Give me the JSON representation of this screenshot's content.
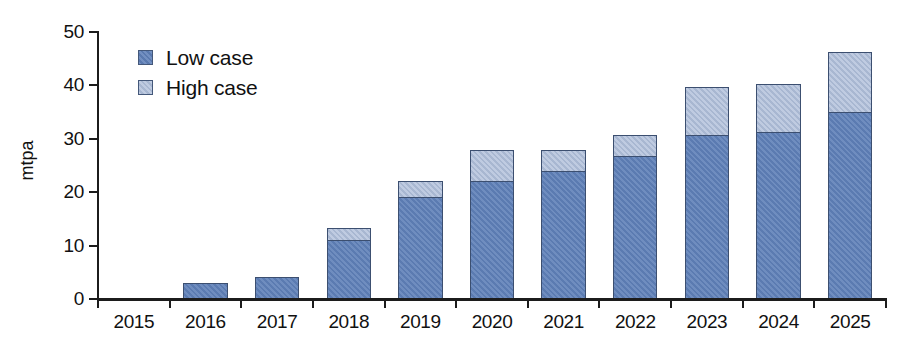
{
  "chart_data": {
    "type": "bar",
    "title": "",
    "subtitle": "",
    "xlabel": "",
    "ylabel": "mtpa",
    "stacked": true,
    "grid": false,
    "legend_position": "top-left",
    "ylim": [
      0,
      50
    ],
    "yticks": [
      0,
      10,
      20,
      30,
      40,
      50
    ],
    "ytick_labels": [
      "0",
      "10",
      "20",
      "30",
      "40",
      "50"
    ],
    "categories": [
      "2015",
      "2016",
      "2017",
      "2018",
      "2019",
      "2020",
      "2021",
      "2022",
      "2023",
      "2024",
      "2025"
    ],
    "series": [
      {
        "name": "Low case",
        "color": "#5f80b8",
        "values": [
          0,
          3.0,
          4.2,
          11.0,
          19.0,
          22.0,
          24.0,
          26.8,
          30.6,
          31.2,
          35.0
        ]
      },
      {
        "name": "High case",
        "color": "#adbdd8",
        "note": "segment drawn above the low case, up to the high case total",
        "totals": [
          0,
          3.0,
          4.2,
          13.2,
          22.0,
          27.8,
          27.8,
          30.6,
          39.6,
          40.1,
          46.2
        ],
        "increments": [
          0,
          0,
          0,
          2.2,
          3.0,
          5.8,
          3.8,
          3.8,
          9.0,
          8.9,
          11.2
        ]
      }
    ],
    "axis_color": "#1c1c1c",
    "bar_border_color": "#3c4f70"
  },
  "legend": {
    "items": [
      {
        "label": "Low case",
        "swatch": "low"
      },
      {
        "label": "High case",
        "swatch": "high"
      }
    ]
  }
}
